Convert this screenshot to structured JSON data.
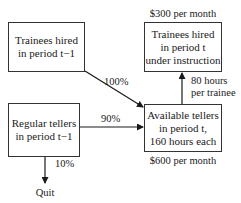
{
  "diagram": {
    "nodes": [
      {
        "id": "trainees_prev",
        "lines": [
          "Trainees hired",
          "in period t−1"
        ]
      },
      {
        "id": "trainees_now",
        "lines": [
          "Trainees hired",
          "in period t",
          "under instruction"
        ]
      },
      {
        "id": "regular_prev",
        "lines": [
          "Regular tellers",
          "in period t−1"
        ]
      },
      {
        "id": "available_now",
        "lines": [
          "Available tellers",
          "in period t,",
          "160 hours each"
        ]
      }
    ],
    "costs": {
      "trainee_cost": "$300 per month",
      "teller_cost": "$600 per month"
    },
    "edges": [
      {
        "from": "trainees_prev",
        "to": "available_now",
        "label": "100%"
      },
      {
        "from": "regular_prev",
        "to": "available_now",
        "label": "90%"
      },
      {
        "from": "available_now",
        "to": "trainees_now",
        "label_lines": [
          "80 hours",
          "per trainee"
        ]
      },
      {
        "from": "regular_prev",
        "to": "quit",
        "label": "10%"
      }
    ],
    "terminal": {
      "quit": "Quit"
    }
  }
}
